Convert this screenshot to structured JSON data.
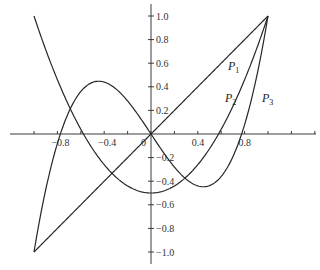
{
  "chart_data": {
    "type": "line",
    "title": "",
    "xlabel": "",
    "ylabel": "",
    "xlim": [
      -1.0,
      1.0
    ],
    "ylim": [
      -1.0,
      1.0
    ],
    "grid": false,
    "legend": "inline curve labels",
    "x_ticks": [
      -0.8,
      -0.4,
      0,
      0.4,
      0.8
    ],
    "x_tick_labels": [
      "−0.8",
      "−0.4",
      "0",
      "0.4",
      "0.8"
    ],
    "y_ticks": [
      1.0,
      0.8,
      0.6,
      0.4,
      0.2,
      -0.2,
      -0.4,
      -0.6,
      -0.8,
      -1.0
    ],
    "y_tick_labels": [
      "1.0",
      "0.8",
      "0.6",
      "0.4",
      "0.2",
      "−0.2",
      "−0.4",
      "−0.6",
      "−0.8",
      "−1.0"
    ],
    "series": [
      {
        "name": "P1",
        "label_main": "P",
        "label_sub": "1",
        "formula": "x",
        "x": [
          -1.0,
          -0.5,
          0,
          0.5,
          1.0
        ],
        "values": [
          -1.0,
          -0.5,
          0,
          0.5,
          1.0
        ]
      },
      {
        "name": "P2",
        "label_main": "P",
        "label_sub": "2",
        "formula": "(3x^2-1)/2",
        "x": [
          -1.0,
          -0.8,
          -0.6,
          -0.4,
          -0.2,
          0,
          0.2,
          0.4,
          0.6,
          0.8,
          1.0
        ],
        "values": [
          1.0,
          0.46,
          0.04,
          -0.26,
          -0.44,
          -0.5,
          -0.44,
          -0.26,
          0.04,
          0.46,
          1.0
        ]
      },
      {
        "name": "P3",
        "label_main": "P",
        "label_sub": "3",
        "formula": "(5x^3-3x)/2",
        "x": [
          -1.0,
          -0.8,
          -0.6,
          -0.4,
          -0.2,
          0,
          0.2,
          0.4,
          0.6,
          0.8,
          1.0
        ],
        "values": [
          -1.0,
          -0.08,
          0.36,
          0.44,
          0.28,
          0,
          -0.28,
          -0.44,
          -0.36,
          0.08,
          1.0
        ]
      }
    ]
  }
}
